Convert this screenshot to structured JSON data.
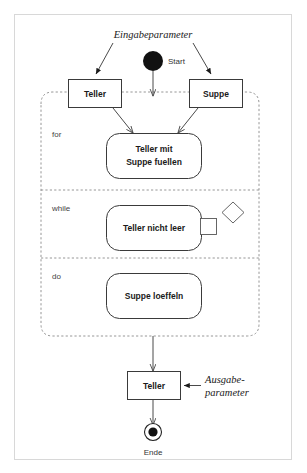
{
  "diagram": {
    "type": "uml-activity-diagram",
    "title": "",
    "canvas": {
      "width": 307,
      "height": 473,
      "background": "#ffffff"
    },
    "colors": {
      "outer_border": "#d8d8d8",
      "shape_stroke": "#3a3a3a",
      "dashed_stroke": "#8a8a8a",
      "flow_stroke": "#4a4a4a",
      "text": "#1a1a1a",
      "node_fill": "#ffffff",
      "start_fill": "#111111"
    },
    "annotations": {
      "input_parameter": "Eingabeparameter",
      "output_parameter_line1": "Ausgabe-",
      "output_parameter_line2": "parameter"
    },
    "nodes": {
      "start": {
        "label": "Start",
        "kind": "initial-node"
      },
      "end": {
        "label": "Ende",
        "kind": "final-node"
      },
      "object_teller_in": {
        "label": "Teller",
        "kind": "object-node"
      },
      "object_suppe_in": {
        "label": "Suppe",
        "kind": "object-node"
      },
      "object_teller_out": {
        "label": "Teller",
        "kind": "object-node"
      },
      "action_fill": {
        "label_line1": "Teller mit",
        "label_line2": "Suppe fuellen",
        "kind": "action"
      },
      "action_test": {
        "label": "Teller nicht leer",
        "kind": "action"
      },
      "action_spoon": {
        "label": "Suppe loeffeln",
        "kind": "action"
      }
    },
    "regions": [
      {
        "id": "for",
        "label": "for"
      },
      {
        "id": "while",
        "label": "while"
      },
      {
        "id": "do",
        "label": "do"
      }
    ],
    "decorations": {
      "pin_square": "output-pin",
      "decision_diamond": "decision-diamond"
    }
  }
}
